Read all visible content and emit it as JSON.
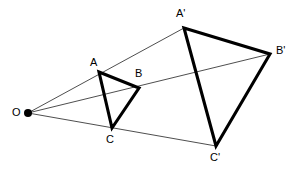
{
  "figure": {
    "background_color": "#ffffff",
    "stroke_color": "#000000",
    "ray_color": "#3a3a3a",
    "width": 298,
    "height": 171
  },
  "labels": {
    "center": "O",
    "a": "A",
    "b": "B",
    "c": "C",
    "a_prime": "A'",
    "b_prime": "B'",
    "c_prime": "C'"
  },
  "geometry": {
    "center_point": {
      "name": "O",
      "x": 28,
      "y": 113,
      "dot_radius": 4
    },
    "source_triangle": {
      "name": "ABC",
      "stroke_width": 3.1,
      "vertices": [
        {
          "name": "A",
          "x": 99,
          "y": 72
        },
        {
          "name": "B",
          "x": 139,
          "y": 88
        },
        {
          "name": "C",
          "x": 112,
          "y": 128
        }
      ],
      "edges": [
        "A-B",
        "B-C",
        "C-A"
      ]
    },
    "image_triangle": {
      "name": "A'B'C'",
      "stroke_width": 3.1,
      "vertices": [
        {
          "name": "A'",
          "x": 184,
          "y": 28
        },
        {
          "name": "B'",
          "x": 270,
          "y": 54
        },
        {
          "name": "C'",
          "x": 216,
          "y": 146
        }
      ],
      "edges": [
        "A'-B'",
        "B'-C'",
        "C'-A'"
      ]
    },
    "rays": [
      {
        "name": "ray-O-A-Aprime",
        "from": "O",
        "through": "A",
        "to": "A'",
        "x1": 28,
        "y1": 113,
        "x2": 184,
        "y2": 28
      },
      {
        "name": "ray-O-B-Bprime",
        "from": "O",
        "through": "B",
        "to": "B'",
        "x1": 28,
        "y1": 113,
        "x2": 270,
        "y2": 54
      },
      {
        "name": "ray-O-C-Cprime",
        "from": "O",
        "through": "C",
        "to": "C'",
        "x1": 28,
        "y1": 113,
        "x2": 216,
        "y2": 146
      }
    ]
  },
  "label_positions": {
    "center": {
      "x": 12,
      "y": 107
    },
    "a": {
      "x": 90,
      "y": 57
    },
    "b": {
      "x": 135,
      "y": 68
    },
    "c": {
      "x": 106,
      "y": 134
    },
    "a_prime": {
      "x": 176,
      "y": 8
    },
    "b_prime": {
      "x": 276,
      "y": 45
    },
    "c_prime": {
      "x": 210,
      "y": 152
    }
  }
}
